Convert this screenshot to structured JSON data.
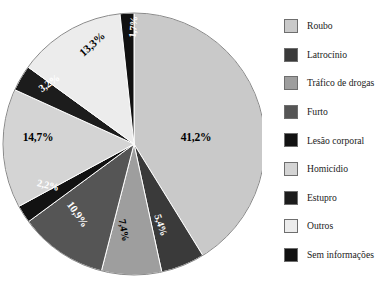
{
  "chart_data": {
    "type": "pie",
    "title": "",
    "subtitle": "",
    "xlabel": "",
    "ylabel": "",
    "legend_position": "right",
    "grid": false,
    "start_angle_deg": 0,
    "direction": "clockwise",
    "value_suffix": "%",
    "decimal_separator": ",",
    "categories": [
      "Roubo",
      "Latrocínio",
      "Tráfico de drogas",
      "Furto",
      "Lesão corporal",
      "Homicídio",
      "Estupro",
      "Outros",
      "Sem informações"
    ],
    "values": [
      41.2,
      5.4,
      7.4,
      10.9,
      2.2,
      14.7,
      3.2,
      13.3,
      1.7
    ],
    "labels": [
      "41,2%",
      "5,4%",
      "7,4%",
      "10,9%",
      "2,2%",
      "14,7%",
      "3,2%",
      "13,3%",
      "1,7%"
    ],
    "colors": [
      "#c9c9c9",
      "#3a3a3a",
      "#9e9e9e",
      "#555555",
      "#121212",
      "#d4d4d4",
      "#1c1c1c",
      "#ececec",
      "#111111"
    ],
    "label_colors": [
      "#000000",
      "#ffffff",
      "#000000",
      "#ffffff",
      "#ffffff",
      "#000000",
      "#ffffff",
      "#000000",
      "#ffffff"
    ],
    "slices": [
      {
        "name": "Roubo",
        "value": 41.2,
        "label": "41,2%",
        "color": "#c9c9c9",
        "label_color": "#000000"
      },
      {
        "name": "Latrocínio",
        "value": 5.4,
        "label": "5,4%",
        "color": "#3a3a3a",
        "label_color": "#ffffff"
      },
      {
        "name": "Tráfico de drogas",
        "value": 7.4,
        "label": "7,4%",
        "color": "#9e9e9e",
        "label_color": "#000000"
      },
      {
        "name": "Furto",
        "value": 10.9,
        "label": "10,9%",
        "color": "#555555",
        "label_color": "#ffffff"
      },
      {
        "name": "Lesão corporal",
        "value": 2.2,
        "label": "2,2%",
        "color": "#121212",
        "label_color": "#ffffff"
      },
      {
        "name": "Homicídio",
        "value": 14.7,
        "label": "14,7%",
        "color": "#d4d4d4",
        "label_color": "#000000"
      },
      {
        "name": "Estupro",
        "value": 3.2,
        "label": "3,2%",
        "color": "#1c1c1c",
        "label_color": "#ffffff"
      },
      {
        "name": "Outros",
        "value": 13.3,
        "label": "13,3%",
        "color": "#ececec",
        "label_color": "#000000"
      },
      {
        "name": "Sem informações",
        "value": 1.7,
        "label": "1,7%",
        "color": "#111111",
        "label_color": "#ffffff"
      }
    ]
  },
  "legend": {
    "items": [
      {
        "label": "Roubo",
        "color": "#c9c9c9"
      },
      {
        "label": "Latrocínio",
        "color": "#3a3a3a"
      },
      {
        "label": "Tráfico de drogas",
        "color": "#9e9e9e"
      },
      {
        "label": "Furto",
        "color": "#555555"
      },
      {
        "label": "Lesão corporal",
        "color": "#121212"
      },
      {
        "label": "Homicídio",
        "color": "#d4d4d4"
      },
      {
        "label": "Estupro",
        "color": "#1c1c1c"
      },
      {
        "label": "Outros",
        "color": "#ececec"
      },
      {
        "label": "Sem informações",
        "color": "#111111"
      }
    ]
  },
  "geometry": {
    "center_x": 134,
    "center_y": 144,
    "radius": 131
  },
  "label_layout": [
    {
      "x": 196,
      "y": 137,
      "rotate": 0,
      "size": 11.5
    },
    {
      "x": 161,
      "y": 225,
      "rotate": -72,
      "size": 10.2
    },
    {
      "x": 124,
      "y": 230,
      "rotate": -80,
      "size": 10.2
    },
    {
      "x": 78,
      "y": 214,
      "rotate": -55,
      "size": 10.8
    },
    {
      "x": 48,
      "y": 185,
      "rotate": -12,
      "size": 10.2
    },
    {
      "x": 38,
      "y": 137,
      "rotate": 0,
      "size": 11.5
    },
    {
      "x": 49,
      "y": 83,
      "rotate": 35,
      "size": 10.5
    },
    {
      "x": 92,
      "y": 44,
      "rotate": 42,
      "size": 11.2
    },
    {
      "x": 133,
      "y": 27,
      "rotate": 85,
      "size": 10.0
    }
  ]
}
